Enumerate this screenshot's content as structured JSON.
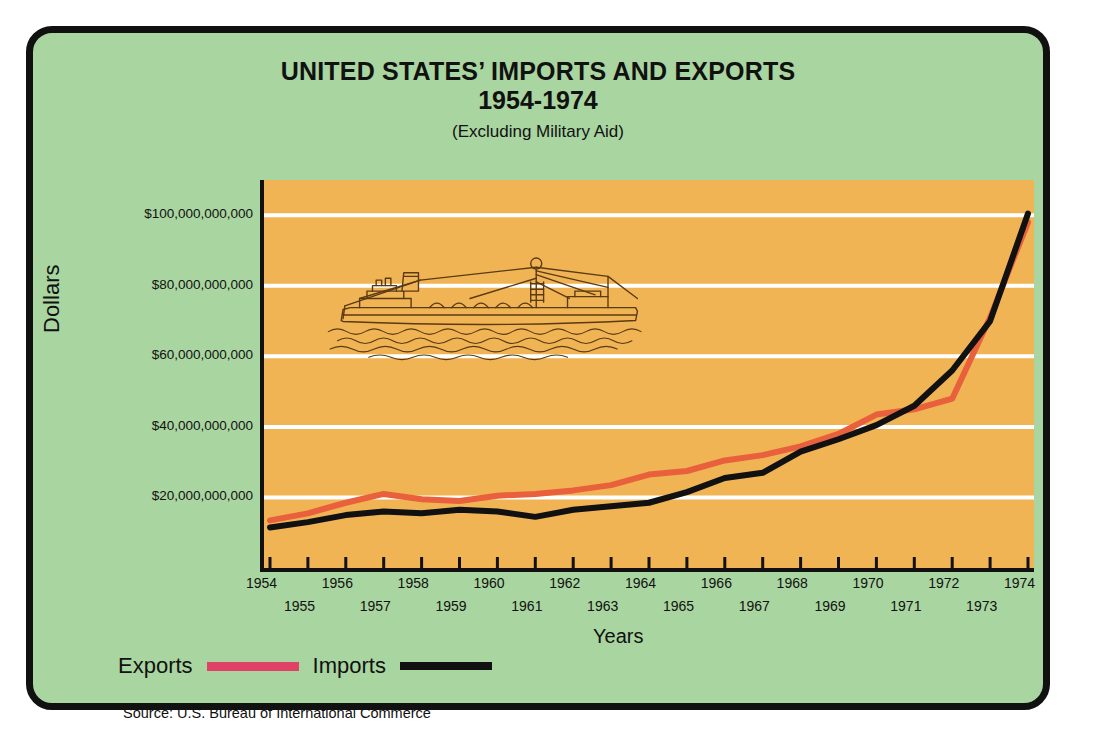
{
  "poster": {
    "background_color": "#a9d5a0",
    "border_color": "#111111"
  },
  "title": {
    "main": "UNITED STATES’ IMPORTS AND EXPORTS",
    "years": "1954-1974",
    "subtitle": "(Excluding Military Aid)"
  },
  "axes": {
    "ylabel": "Dollars",
    "xlabel": "Years"
  },
  "legend": {
    "exports_label": "Exports",
    "imports_label": "Imports",
    "exports_color": "#e04267",
    "imports_color": "#111111"
  },
  "source": "Source: U.S. Bureau of International Commerce",
  "illustration": "cargo-ship-illustration",
  "chart_data": {
    "type": "line",
    "title": "UNITED STATES’ IMPORTS AND EXPORTS 1954-1974",
    "subtitle": "(Excluding Military Aid)",
    "xlabel": "Years",
    "ylabel": "Dollars",
    "plot_background": "#f0b454",
    "grid": true,
    "grid_color": "#ffffff",
    "legend_position": "below-left",
    "x": [
      1954,
      1955,
      1956,
      1957,
      1958,
      1959,
      1960,
      1961,
      1962,
      1963,
      1964,
      1965,
      1966,
      1967,
      1968,
      1969,
      1970,
      1971,
      1972,
      1973,
      1974
    ],
    "xtick_labels_top": [
      "1954",
      "1956",
      "1958",
      "1960",
      "1962",
      "1964",
      "1966",
      "1968",
      "1970",
      "1972",
      "1974"
    ],
    "xtick_labels_bottom": [
      "1955",
      "1957",
      "1959",
      "1961",
      "1963",
      "1965",
      "1967",
      "1969",
      "1971",
      "1973"
    ],
    "xlim": [
      1954,
      1974
    ],
    "ylim": [
      0,
      110000000000
    ],
    "ytick_labels": [
      "$100,000,000,000",
      "$80,000,000,000",
      "$60,000,000,000",
      "$40,000,000,000",
      "$20,000,000,000"
    ],
    "ytick_values": [
      100000000000,
      80000000000,
      60000000000,
      40000000000,
      20000000000
    ],
    "series": [
      {
        "name": "Exports",
        "color": "#e8603c",
        "values": [
          13500000000,
          15500000000,
          18500000000,
          21000000000,
          19500000000,
          19000000000,
          20500000000,
          21000000000,
          22000000000,
          23500000000,
          26500000000,
          27500000000,
          30500000000,
          32000000000,
          34500000000,
          38000000000,
          43500000000,
          45000000000,
          48000000000,
          71000000000,
          98000000000
        ]
      },
      {
        "name": "Imports",
        "color": "#111111",
        "values": [
          11500000000,
          13000000000,
          15000000000,
          16000000000,
          15500000000,
          16500000000,
          16000000000,
          14500000000,
          16500000000,
          17500000000,
          18500000000,
          21500000000,
          25500000000,
          27000000000,
          33000000000,
          36500000000,
          40500000000,
          46000000000,
          56000000000,
          70000000000,
          100500000000
        ]
      }
    ]
  }
}
